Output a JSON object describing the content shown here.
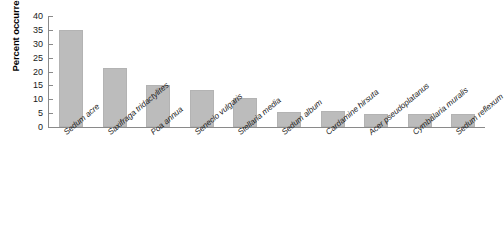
{
  "chart_data": {
    "type": "bar",
    "title": "",
    "subtitle": "",
    "xlabel": "",
    "ylabel": "Percent occurrence",
    "ylim": [
      0,
      40
    ],
    "yticks": [
      0,
      5,
      10,
      15,
      20,
      25,
      30,
      35,
      40
    ],
    "ytick_labels": [
      "0",
      "5",
      "10",
      "15",
      "20",
      "25",
      "30",
      "35",
      "40"
    ],
    "grid": false,
    "legend": null,
    "bar_color": "#bcbcbc",
    "axis_color": "#8a8a8a",
    "background_color": "#ffffff",
    "categories": [
      "Sedum acre",
      "Saxifraga tridactylites",
      "Poa annua",
      "Senecio vulgaris",
      "Stellaria media",
      "Sedum album",
      "Cardamine hirsuta",
      "Acer pseudoplatanus",
      "Cymbalaria muralis",
      "Sedum reflexum"
    ],
    "values": [
      34.8,
      21.2,
      15.3,
      13.4,
      10.3,
      5.5,
      5.6,
      4.6,
      4.7,
      4.7
    ]
  }
}
